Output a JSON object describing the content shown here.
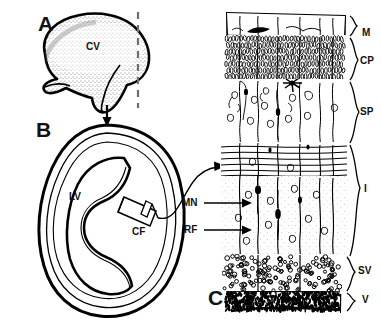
{
  "figure": {
    "panels": [
      {
        "id": "A",
        "letter": "A",
        "caption": "Cerebral vesicle, lateral view with plane of section"
      },
      {
        "id": "B",
        "letter": "B",
        "caption": "Coronal section through cerebral vesicle"
      },
      {
        "id": "C",
        "letter": "C",
        "caption": "Cortical wall showing layers and radial migration"
      }
    ]
  },
  "panelA": {
    "letter": "A",
    "labels": [
      {
        "name": "cerebral-vesicle",
        "text": "CV",
        "x": 92,
        "y": 46
      }
    ],
    "section_plane": {
      "name": "dashed-section-line",
      "style": "dashed"
    }
  },
  "panelB": {
    "letter": "B",
    "labels": [
      {
        "name": "lateral-ventricle",
        "text": "LV",
        "x": 73,
        "y": 196
      },
      {
        "name": "cortical-field",
        "text": "CF",
        "x": 135,
        "y": 230
      }
    ]
  },
  "panelC": {
    "letter": "C",
    "zones": [
      {
        "abbr": "M",
        "name": "marginal-zone",
        "full": "Marginal zone",
        "top": 14,
        "bottom": 36
      },
      {
        "abbr": "CP",
        "name": "cortical-plate",
        "full": "Cortical plate",
        "top": 36,
        "bottom": 80
      },
      {
        "abbr": "SP",
        "name": "subplate",
        "full": "Subplate",
        "top": 80,
        "bottom": 143
      },
      {
        "abbr": "I",
        "name": "intermediate-zone",
        "full": "Intermediate zone",
        "top": 143,
        "bottom": 255
      },
      {
        "abbr": "SV",
        "name": "subventricular-zone",
        "full": "Subventricular zone",
        "top": 255,
        "bottom": 292
      },
      {
        "abbr": "V",
        "name": "ventricular-zone",
        "full": "Ventricular zone",
        "top": 292,
        "bottom": 312
      }
    ],
    "zone_label_positions": [
      {
        "abbr": "M",
        "x": 362,
        "y": 34
      },
      {
        "abbr": "CP",
        "x": 360,
        "y": 63
      },
      {
        "abbr": "SP",
        "x": 360,
        "y": 113
      },
      {
        "abbr": "I",
        "x": 363,
        "y": 190
      },
      {
        "abbr": "SV",
        "x": 358,
        "y": 272
      },
      {
        "abbr": "V",
        "x": 362,
        "y": 300
      }
    ],
    "structures": [
      {
        "abbr": "MN",
        "name": "migrating-neuron",
        "full": "Migrating neuron",
        "x": 186,
        "y": 202
      },
      {
        "abbr": "RF",
        "name": "radial-fiber",
        "full": "Radial fiber",
        "x": 188,
        "y": 229
      }
    ]
  },
  "colors": {
    "ink": "#000000",
    "paper": "#ffffff",
    "stipple": "#8a8a8a",
    "dash": "#6d6d6d"
  }
}
